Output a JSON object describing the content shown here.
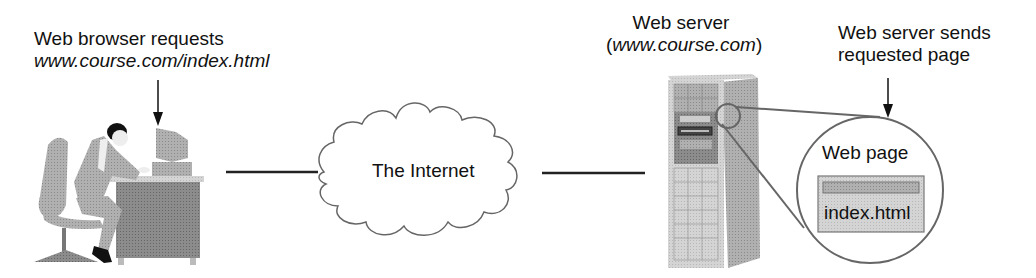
{
  "diagram": {
    "type": "client-server web request flow",
    "client": {
      "label_line1": "Web browser requests",
      "label_line2": "www.course.com/index.html",
      "icon": "person-at-computer-desk"
    },
    "network": {
      "label": "The Internet",
      "icon": "cloud"
    },
    "server": {
      "label_line1": "Web server",
      "label_line2_open": "(",
      "label_line2_domain": "www.course.com",
      "label_line2_close": ")",
      "icon": "tower-server"
    },
    "response": {
      "label_line1": "Web server sends",
      "label_line2": "requested page"
    },
    "web_page": {
      "title": "Web page",
      "filename": "index.html"
    }
  },
  "colors": {
    "line": "#222222",
    "gray_fill": "#a8a8a8",
    "light_gray": "#d2d2d2",
    "outline_gray": "#777777"
  }
}
